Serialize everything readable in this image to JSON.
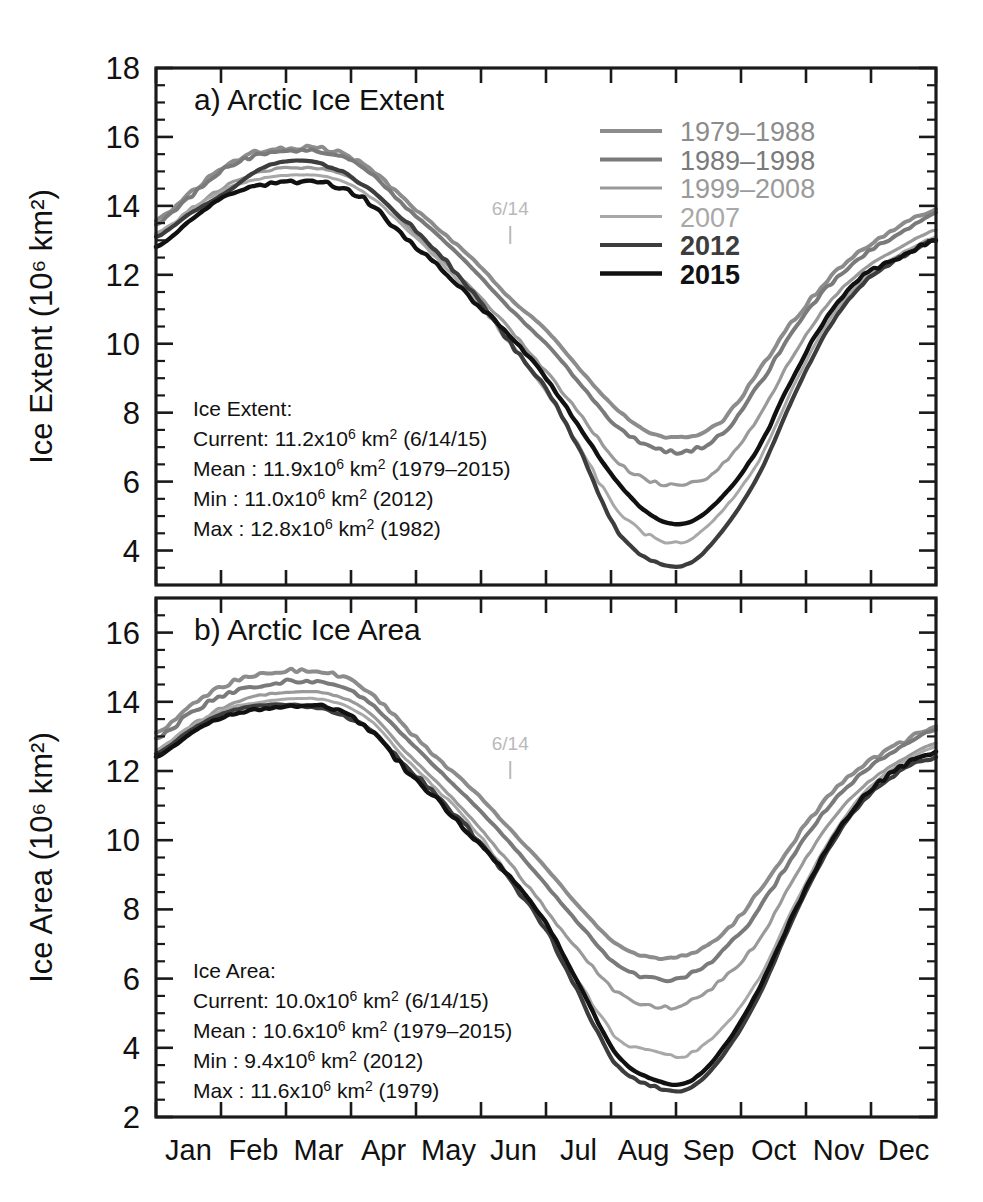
{
  "figure": {
    "background_color": "#ffffff",
    "width": 983,
    "height": 1202
  },
  "panels": [
    {
      "id": "a",
      "title": "a) Arctic Ice Extent",
      "ylabel_main": "Ice Extent (10",
      "ylabel_exp": "6",
      "ylabel_tail": " km",
      "ylabel_tail_exp": "2",
      "ylabel_close": ")",
      "ylabel_full": "Ice Extent (10⁶ km²)",
      "ytick_labels": [
        "18",
        "16",
        "14",
        "12",
        "10",
        "8",
        "6",
        "4"
      ],
      "marker_label": "6/14",
      "stats": {
        "heading": "Ice Extent:",
        "rows": [
          {
            "label": "Current:",
            "value": "11.2x10",
            "exp": "6",
            "unit": " km",
            "unit_exp": "2",
            "paren": " (6/14/15)"
          },
          {
            "label": "Mean   :",
            "value": "11.9x10",
            "exp": "6",
            "unit": " km",
            "unit_exp": "2",
            "paren": " (1979–2015)"
          },
          {
            "label": "Min    :",
            "value": "11.0x10",
            "exp": "6",
            "unit": " km",
            "unit_exp": "2",
            "paren": " (2012)"
          },
          {
            "label": "Max    :",
            "value": "12.8x10",
            "exp": "6",
            "unit": " km",
            "unit_exp": "2",
            "paren": " (1982)"
          }
        ]
      }
    },
    {
      "id": "b",
      "title": "b) Arctic Ice Area",
      "ylabel_full": "Ice Area (10⁶ km²)",
      "ytick_labels": [
        "16",
        "14",
        "12",
        "10",
        "8",
        "6",
        "4",
        "2"
      ],
      "marker_label": "6/14",
      "stats": {
        "heading": "Ice Area:",
        "rows": [
          {
            "label": "Current:",
            "value": "10.0x10",
            "exp": "6",
            "unit": " km",
            "unit_exp": "2",
            "paren": " (6/14/15)"
          },
          {
            "label": "Mean   :",
            "value": "10.6x10",
            "exp": "6",
            "unit": " km",
            "unit_exp": "2",
            "paren": " (1979–2015)"
          },
          {
            "label": "Min    :",
            "value": "  9.4x10",
            "exp": "6",
            "unit": " km",
            "unit_exp": "2",
            "paren": " (2012)"
          },
          {
            "label": "Max    :",
            "value": "11.6x10",
            "exp": "6",
            "unit": " km",
            "unit_exp": "2",
            "paren": " (1979)"
          }
        ]
      }
    }
  ],
  "legend": {
    "position": "top-right-panel-a",
    "entries": [
      {
        "label": "1979–1988",
        "color": "#8c8c8c",
        "width": 4.0,
        "bold": false
      },
      {
        "label": "1989–1998",
        "color": "#7a7a7a",
        "width": 4.0,
        "bold": false
      },
      {
        "label": "1999–2008",
        "color": "#9a9a9a",
        "width": 3.2,
        "bold": false
      },
      {
        "label": "2007",
        "color": "#a8a8a8",
        "width": 3.0,
        "bold": false
      },
      {
        "label": "2012",
        "color": "#3d3d3d",
        "width": 4.2,
        "bold": true
      },
      {
        "label": "2015",
        "color": "#111111",
        "width": 4.4,
        "bold": true
      }
    ]
  },
  "xaxis": {
    "tick_labels": [
      "Jan",
      "Feb",
      "Mar",
      "Apr",
      "May",
      "Jun",
      "Jul",
      "Aug",
      "Sep",
      "Oct",
      "Nov",
      "Dec"
    ]
  },
  "chart_data": {
    "type": "line",
    "xlabel": "",
    "x": [
      "Jan",
      "Feb",
      "Mar",
      "Apr",
      "May",
      "Jun",
      "Jul",
      "Aug",
      "Sep",
      "Oct",
      "Nov",
      "Dec"
    ],
    "grid": false,
    "legend_position": "upper right",
    "panels": [
      {
        "id": "a",
        "title": "a) Arctic Ice Extent",
        "ylabel": "Ice Extent (10^6 km^2)",
        "ylim": [
          3,
          18
        ],
        "yticks": [
          4,
          6,
          8,
          10,
          12,
          14,
          16,
          18
        ],
        "units": "10^6 km^2",
        "series": [
          {
            "name": "1979–1988",
            "color": "#8c8c8c",
            "values": [
              14.0,
              15.2,
              15.7,
              15.4,
              14.2,
              12.5,
              10.4,
              8.4,
              7.3,
              9.2,
              11.6,
              13.3
            ],
            "monthly_detail": [
              13.6,
              14.4,
              15.2,
              15.6,
              15.7,
              15.6,
              15.1,
              14.2,
              13.3,
              12.4,
              11.3,
              10.4,
              9.2,
              8.1,
              7.4,
              7.3,
              7.8,
              9.2,
              10.7,
              11.9,
              12.8,
              13.4,
              13.9
            ]
          },
          {
            "name": "1989–1998",
            "color": "#7a7a7a",
            "values": [
              13.9,
              15.0,
              15.6,
              15.3,
              14.0,
              12.2,
              10.0,
              7.9,
              6.9,
              8.8,
              11.3,
              13.2
            ],
            "monthly_detail": [
              13.5,
              14.3,
              15.1,
              15.5,
              15.6,
              15.5,
              15.0,
              14.0,
              13.1,
              12.1,
              11.0,
              10.0,
              8.8,
              7.6,
              7.0,
              6.9,
              7.4,
              8.8,
              10.4,
              11.7,
              12.6,
              13.2,
              13.8
            ]
          },
          {
            "name": "1999–2008",
            "color": "#9a9a9a",
            "values": [
              13.6,
              14.6,
              15.1,
              14.8,
              13.5,
              11.6,
              9.2,
              6.9,
              5.9,
              7.9,
              10.7,
              12.8
            ],
            "monthly_detail": [
              13.1,
              13.9,
              14.6,
              15.0,
              15.1,
              15.0,
              14.5,
              13.5,
              12.5,
              11.5,
              10.4,
              9.2,
              7.9,
              6.6,
              6.0,
              5.9,
              6.5,
              7.9,
              9.7,
              11.2,
              12.2,
              12.8,
              13.3
            ]
          },
          {
            "name": "2007",
            "color": "#a8a8a8",
            "values": [
              13.6,
              14.5,
              14.9,
              14.6,
              13.4,
              11.5,
              8.6,
              5.6,
              4.3,
              6.6,
              10.0,
              12.6
            ],
            "monthly_detail": [
              13.2,
              13.9,
              14.5,
              14.8,
              14.9,
              14.8,
              14.3,
              13.4,
              12.4,
              11.3,
              10.0,
              8.6,
              6.9,
              5.2,
              4.4,
              4.3,
              5.2,
              6.6,
              8.8,
              10.7,
              11.9,
              12.6,
              13.1
            ]
          },
          {
            "name": "2012",
            "color": "#3d3d3d",
            "values": [
              13.5,
              14.5,
              15.3,
              14.9,
              13.6,
              11.5,
              8.7,
              5.2,
              3.6,
              6.2,
              9.7,
              12.5
            ],
            "monthly_detail": [
              13.1,
              13.8,
              14.4,
              15.1,
              15.3,
              15.1,
              14.5,
              13.6,
              12.6,
              11.4,
              10.0,
              8.7,
              6.8,
              4.6,
              3.7,
              3.6,
              4.6,
              6.2,
              8.5,
              10.5,
              11.8,
              12.5,
              13.0
            ]
          },
          {
            "name": "2015",
            "color": "#111111",
            "values": [
              13.3,
              14.3,
              14.7,
              14.3,
              13.1,
              11.2,
              9.0,
              6.3,
              4.8,
              7.0,
              10.3,
              12.5
            ],
            "monthly_detail": [
              12.8,
              13.6,
              14.3,
              14.6,
              14.7,
              14.6,
              14.1,
              13.1,
              12.2,
              11.2,
              10.2,
              9.0,
              7.5,
              6.0,
              5.0,
              4.8,
              5.6,
              7.0,
              9.1,
              10.9,
              12.0,
              12.5,
              13.0
            ]
          }
        ],
        "annotations": [
          {
            "text": "6/14",
            "x": "mid-Jun",
            "color": "#b9b9b9"
          }
        ],
        "stats_box": {
          "heading": "Ice Extent:",
          "current": {
            "value": 11.2,
            "date": "6/14/15"
          },
          "mean": {
            "value": 11.9,
            "period": "1979–2015"
          },
          "min": {
            "value": 11.0,
            "year": 2012
          },
          "max": {
            "value": 12.8,
            "year": 1982
          }
        }
      },
      {
        "id": "b",
        "title": "b) Arctic Ice Area",
        "ylabel": "Ice Area (10^6 km^2)",
        "ylim": [
          2,
          17
        ],
        "yticks": [
          2,
          4,
          6,
          8,
          10,
          12,
          14,
          16
        ],
        "units": "10^6 km^2",
        "series": [
          {
            "name": "1979–1988",
            "color": "#8c8c8c",
            "values": [
              13.5,
              14.5,
              14.9,
              14.6,
              13.3,
              11.4,
              9.2,
              7.3,
              6.6,
              8.5,
              11.0,
              12.8
            ],
            "monthly_detail": [
              13.1,
              13.9,
              14.5,
              14.8,
              14.9,
              14.8,
              14.3,
              13.3,
              12.3,
              11.4,
              10.3,
              9.2,
              8.0,
              7.0,
              6.6,
              6.7,
              7.3,
              8.5,
              10.0,
              11.3,
              12.2,
              12.8,
              13.3
            ]
          },
          {
            "name": "1989–1998",
            "color": "#7a7a7a",
            "values": [
              13.3,
              14.2,
              14.6,
              14.3,
              13.0,
              11.0,
              8.7,
              6.7,
              6.0,
              8.0,
              10.7,
              12.7
            ],
            "monthly_detail": [
              12.9,
              13.7,
              14.2,
              14.5,
              14.6,
              14.5,
              14.0,
              13.0,
              12.0,
              11.0,
              9.9,
              8.7,
              7.5,
              6.4,
              6.0,
              6.1,
              6.8,
              8.0,
              9.6,
              11.0,
              12.0,
              12.7,
              13.2
            ]
          },
          {
            "name": "1999–2008",
            "color": "#9a9a9a",
            "values": [
              13.0,
              13.9,
              14.3,
              14.0,
              12.6,
              10.5,
              8.0,
              5.9,
              5.2,
              7.1,
              10.0,
              12.3
            ],
            "monthly_detail": [
              12.5,
              13.3,
              13.9,
              14.2,
              14.3,
              14.2,
              13.7,
              12.6,
              11.6,
              10.5,
              9.3,
              8.0,
              6.7,
              5.6,
              5.2,
              5.3,
              6.0,
              7.1,
              8.9,
              10.5,
              11.6,
              12.3,
              12.8
            ]
          },
          {
            "name": "2007",
            "color": "#a8a8a8",
            "values": [
              13.0,
              13.8,
              14.1,
              13.8,
              12.4,
              10.3,
              7.4,
              4.6,
              3.8,
              6.0,
              9.5,
              12.2
            ],
            "monthly_detail": [
              12.6,
              13.3,
              13.8,
              14.0,
              14.1,
              14.0,
              13.5,
              12.4,
              11.4,
              10.3,
              8.9,
              7.4,
              5.8,
              4.3,
              3.9,
              3.8,
              4.6,
              6.0,
              8.1,
              10.0,
              11.4,
              12.2,
              12.7
            ]
          },
          {
            "name": "2012",
            "color": "#3d3d3d",
            "values": [
              12.9,
              13.7,
              13.9,
              13.5,
              12.2,
              10.1,
              7.4,
              4.2,
              2.8,
              5.5,
              9.2,
              12.0
            ],
            "monthly_detail": [
              12.5,
              13.2,
              13.7,
              13.9,
              13.9,
              13.7,
              13.2,
              12.2,
              11.2,
              10.1,
              8.8,
              7.4,
              5.4,
              3.5,
              2.9,
              2.8,
              3.8,
              5.5,
              7.8,
              9.8,
              11.2,
              12.0,
              12.4
            ]
          },
          {
            "name": "2015",
            "color": "#111111",
            "values": [
              12.7,
              13.6,
              13.9,
              13.5,
              12.1,
              10.0,
              7.6,
              4.4,
              3.0,
              5.7,
              9.4,
              12.1
            ],
            "monthly_detail": [
              12.4,
              13.1,
              13.6,
              13.8,
              13.9,
              13.8,
              13.2,
              12.1,
              11.1,
              10.0,
              8.9,
              7.6,
              5.7,
              3.8,
              3.1,
              3.0,
              4.0,
              5.7,
              7.9,
              9.9,
              11.3,
              12.1,
              12.5
            ]
          }
        ],
        "annotations": [
          {
            "text": "6/14",
            "x": "mid-Jun",
            "color": "#b9b9b9"
          }
        ],
        "stats_box": {
          "heading": "Ice Area:",
          "current": {
            "value": 10.0,
            "date": "6/14/15"
          },
          "mean": {
            "value": 10.6,
            "period": "1979–2015"
          },
          "min": {
            "value": 9.4,
            "year": 2012
          },
          "max": {
            "value": 11.6,
            "year": 1979
          }
        }
      }
    ]
  }
}
